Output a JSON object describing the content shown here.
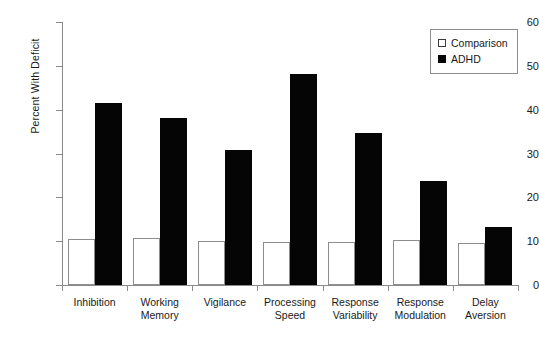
{
  "chart_data": {
    "type": "bar",
    "title": "",
    "xlabel": "",
    "ylabel": "Percent With Deficit",
    "ylim": [
      0,
      60
    ],
    "ytick_labels": [
      "0",
      "10",
      "20",
      "30",
      "40",
      "50",
      "60"
    ],
    "yticks": [
      0,
      10,
      20,
      30,
      40,
      50,
      60
    ],
    "grid": false,
    "legend_position": "top-right",
    "categories": [
      "Inhibition",
      "Working\nMemory",
      "Vigilance",
      "Processing\nSpeed",
      "Response\nVariability",
      "Response\nModulation",
      "Delay\nAversion"
    ],
    "series": [
      {
        "name": "Comparison",
        "color": "#ffffff",
        "edge_color": "#8d8d8d",
        "values": [
          10.4,
          10.7,
          10.0,
          9.8,
          9.9,
          10.3,
          9.6
        ]
      },
      {
        "name": "ADHD",
        "color": "#050505",
        "edge_color": "#050505",
        "values": [
          41.5,
          38.1,
          30.8,
          48.2,
          34.7,
          23.8,
          13.3
        ]
      }
    ]
  },
  "legend": {
    "items": [
      {
        "label": "Comparison",
        "swatch": "open-square"
      },
      {
        "label": "ADHD",
        "swatch": "filled-square"
      }
    ]
  }
}
